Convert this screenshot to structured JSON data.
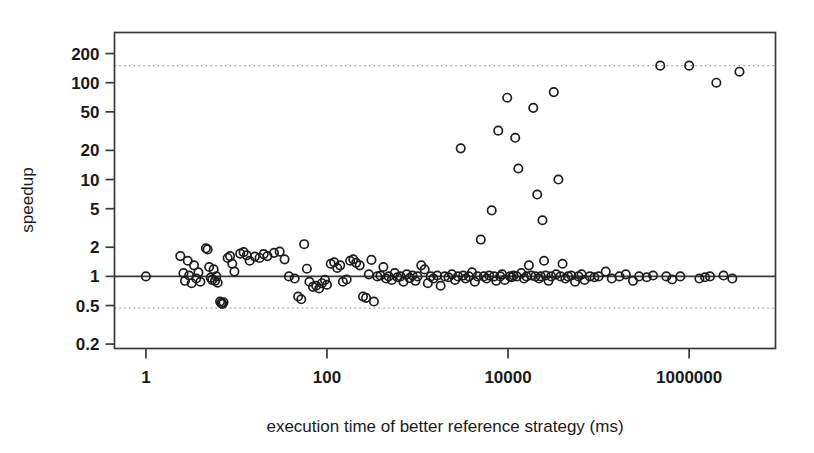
{
  "chart_data": {
    "type": "scatter",
    "title": "",
    "xlabel": "execution time of better reference strategy (ms)",
    "ylabel": "speedup",
    "xscale": "log",
    "yscale": "log",
    "xlim": [
      0.45,
      9000000
    ],
    "ylim": [
      0.18,
      330
    ],
    "grid": false,
    "legend": null,
    "xticks": [
      1,
      100,
      10000,
      1000000
    ],
    "xtick_labels": [
      "1",
      "100",
      "10000",
      "1000000"
    ],
    "yticks": [
      200,
      100,
      50,
      20,
      10,
      5,
      2,
      1,
      0.5,
      0.2
    ],
    "ytick_labels": [
      "200",
      "100",
      "50",
      "20",
      "10",
      "5",
      "2",
      "1",
      "0.5",
      "0.2"
    ],
    "reference_lines": [
      {
        "name": "upper-bound-dotted",
        "y": 150,
        "style": "dotted",
        "color": "#9a9a9a"
      },
      {
        "name": "unity-solid",
        "y": 1,
        "style": "solid",
        "color": "#3a3a3a"
      },
      {
        "name": "lower-bound-dotted",
        "y": 0.47,
        "style": "dotted",
        "color": "#9a9a9a"
      }
    ],
    "marker": {
      "shape": "circle-open",
      "radius": 4.2,
      "stroke": "#1d1d1d"
    },
    "points": [
      [
        1.0,
        1.0
      ],
      [
        2.4,
        1.62
      ],
      [
        2.6,
        1.08
      ],
      [
        2.7,
        0.9
      ],
      [
        2.9,
        1.45
      ],
      [
        3.0,
        1.02
      ],
      [
        3.2,
        0.85
      ],
      [
        3.4,
        1.3
      ],
      [
        3.6,
        0.95
      ],
      [
        3.8,
        1.1
      ],
      [
        4.0,
        0.88
      ],
      [
        4.6,
        1.95
      ],
      [
        4.8,
        1.9
      ],
      [
        5.0,
        1.25
      ],
      [
        5.2,
        0.97
      ],
      [
        5.4,
        0.92
      ],
      [
        5.6,
        1.18
      ],
      [
        5.8,
        0.9
      ],
      [
        6.0,
        1.0
      ],
      [
        6.2,
        0.86
      ],
      [
        6.6,
        0.55
      ],
      [
        6.8,
        0.53
      ],
      [
        7.0,
        0.52
      ],
      [
        7.2,
        0.54
      ],
      [
        8.0,
        1.55
      ],
      [
        8.5,
        1.62
      ],
      [
        9.0,
        1.35
      ],
      [
        9.5,
        1.12
      ],
      [
        11.0,
        1.72
      ],
      [
        12.0,
        1.78
      ],
      [
        13.0,
        1.65
      ],
      [
        14.0,
        1.45
      ],
      [
        16.0,
        1.6
      ],
      [
        18.0,
        1.55
      ],
      [
        20.0,
        1.7
      ],
      [
        22.0,
        1.62
      ],
      [
        26.0,
        1.75
      ],
      [
        30.0,
        1.8
      ],
      [
        34.0,
        1.5
      ],
      [
        38.0,
        1.0
      ],
      [
        44.0,
        0.95
      ],
      [
        48.0,
        0.62
      ],
      [
        52.0,
        0.58
      ],
      [
        56.0,
        2.15
      ],
      [
        60.0,
        1.2
      ],
      [
        64.0,
        0.88
      ],
      [
        70.0,
        0.78
      ],
      [
        76.0,
        0.8
      ],
      [
        82.0,
        0.75
      ],
      [
        88.0,
        0.85
      ],
      [
        95.0,
        0.92
      ],
      [
        100.0,
        0.82
      ],
      [
        110.0,
        1.35
      ],
      [
        120.0,
        1.4
      ],
      [
        130.0,
        1.22
      ],
      [
        140.0,
        1.3
      ],
      [
        150.0,
        0.88
      ],
      [
        165.0,
        0.93
      ],
      [
        180.0,
        1.45
      ],
      [
        195.0,
        1.5
      ],
      [
        210.0,
        1.38
      ],
      [
        230.0,
        1.3
      ],
      [
        250.0,
        0.62
      ],
      [
        270.0,
        0.6
      ],
      [
        290.0,
        1.05
      ],
      [
        310.0,
        1.48
      ],
      [
        330.0,
        0.55
      ],
      [
        360.0,
        1.0
      ],
      [
        390.0,
        1.02
      ],
      [
        420.0,
        1.25
      ],
      [
        450.0,
        0.95
      ],
      [
        480.0,
        1.0
      ],
      [
        520.0,
        0.92
      ],
      [
        560.0,
        1.08
      ],
      [
        600.0,
        0.98
      ],
      [
        650.0,
        1.0
      ],
      [
        700.0,
        0.88
      ],
      [
        760.0,
        1.05
      ],
      [
        820.0,
        0.96
      ],
      [
        880.0,
        1.02
      ],
      [
        950.0,
        0.9
      ],
      [
        1000.0,
        1.0
      ],
      [
        1100.0,
        1.3
      ],
      [
        1200.0,
        1.18
      ],
      [
        1300.0,
        0.85
      ],
      [
        1400.0,
        1.0
      ],
      [
        1500.0,
        0.95
      ],
      [
        1650.0,
        1.02
      ],
      [
        1800.0,
        0.8
      ],
      [
        2000.0,
        1.0
      ],
      [
        2200.0,
        0.98
      ],
      [
        2400.0,
        1.05
      ],
      [
        2600.0,
        0.92
      ],
      [
        2800.0,
        1.0
      ],
      [
        3000.0,
        21.0
      ],
      [
        3200.0,
        1.02
      ],
      [
        3400.0,
        0.95
      ],
      [
        3700.0,
        1.0
      ],
      [
        4000.0,
        1.1
      ],
      [
        4300.0,
        0.88
      ],
      [
        4600.0,
        1.0
      ],
      [
        5000.0,
        2.4
      ],
      [
        5400.0,
        1.0
      ],
      [
        5800.0,
        0.95
      ],
      [
        6200.0,
        1.02
      ],
      [
        6600.0,
        4.8
      ],
      [
        7000.0,
        1.0
      ],
      [
        7400.0,
        0.9
      ],
      [
        7800.0,
        32.0
      ],
      [
        8200.0,
        1.0
      ],
      [
        8600.0,
        1.05
      ],
      [
        9200.0,
        0.92
      ],
      [
        9800.0,
        70.0
      ],
      [
        10500.0,
        1.0
      ],
      [
        11000.0,
        0.98
      ],
      [
        11500.0,
        1.02
      ],
      [
        12000.0,
        27.0
      ],
      [
        12500.0,
        1.0
      ],
      [
        13000.0,
        13.0
      ],
      [
        14000.0,
        1.08
      ],
      [
        15000.0,
        0.95
      ],
      [
        16000.0,
        1.0
      ],
      [
        17000.0,
        1.3
      ],
      [
        18000.0,
        1.02
      ],
      [
        19000.0,
        55.0
      ],
      [
        20000.0,
        1.0
      ],
      [
        21000.0,
        7.0
      ],
      [
        22000.0,
        0.95
      ],
      [
        23000.0,
        1.0
      ],
      [
        24000.0,
        3.8
      ],
      [
        25000.0,
        1.45
      ],
      [
        26000.0,
        1.02
      ],
      [
        28000.0,
        0.9
      ],
      [
        30000.0,
        1.0
      ],
      [
        32000.0,
        80.0
      ],
      [
        34000.0,
        1.05
      ],
      [
        36000.0,
        10.0
      ],
      [
        38000.0,
        1.0
      ],
      [
        40000.0,
        1.35
      ],
      [
        43000.0,
        0.95
      ],
      [
        46000.0,
        1.0
      ],
      [
        50000.0,
        1.02
      ],
      [
        55000.0,
        0.88
      ],
      [
        60000.0,
        1.0
      ],
      [
        65000.0,
        1.05
      ],
      [
        70000.0,
        0.92
      ],
      [
        80000.0,
        1.0
      ],
      [
        90000.0,
        0.98
      ],
      [
        100000.0,
        1.0
      ],
      [
        120000.0,
        1.12
      ],
      [
        140000.0,
        0.95
      ],
      [
        170000.0,
        1.0
      ],
      [
        200000.0,
        1.05
      ],
      [
        240000.0,
        0.9
      ],
      [
        280000.0,
        1.0
      ],
      [
        340000.0,
        0.98
      ],
      [
        400000.0,
        1.02
      ],
      [
        480000.0,
        150.0
      ],
      [
        560000.0,
        1.0
      ],
      [
        650000.0,
        0.93
      ],
      [
        800000.0,
        1.0
      ],
      [
        1000000.0,
        150.0
      ],
      [
        1300000.0,
        0.95
      ],
      [
        1500000.0,
        0.98
      ],
      [
        1700000.0,
        1.0
      ],
      [
        2000000.0,
        100.0
      ],
      [
        2400000.0,
        1.02
      ],
      [
        3000000.0,
        0.95
      ],
      [
        3600000.0,
        130.0
      ]
    ]
  }
}
